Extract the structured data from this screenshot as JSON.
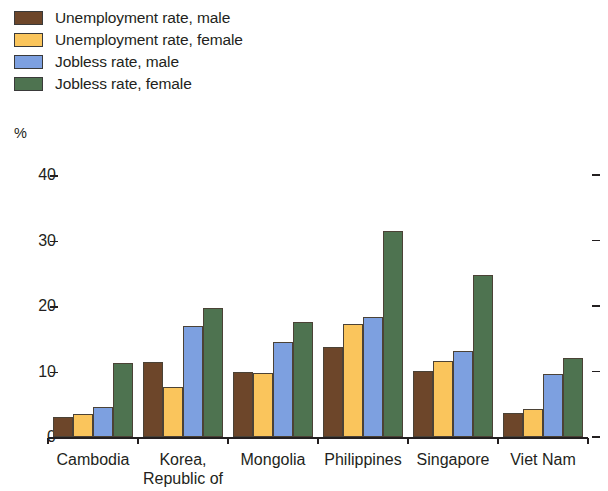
{
  "chart_data": {
    "type": "bar",
    "title": "",
    "subtitle": "",
    "xlabel": "",
    "ylabel": "%",
    "ylim": [
      0,
      40
    ],
    "yticks": [
      0,
      10,
      20,
      30,
      40
    ],
    "grid": false,
    "legend_position": "top-left",
    "categories": [
      "Cambodia",
      "Korea,\nRepublic of",
      "Mongolia",
      "Philippines",
      "Singapore",
      "Viet Nam"
    ],
    "category_lines": [
      [
        "Cambodia"
      ],
      [
        "Korea,",
        "Republic of"
      ],
      [
        "Mongolia"
      ],
      [
        "Philippines"
      ],
      [
        "Singapore"
      ],
      [
        "Viet Nam"
      ]
    ],
    "series": [
      {
        "name": "Unemployment rate, male",
        "color": "#6d462a",
        "values": [
          3.1,
          11.4,
          10.0,
          13.8,
          10.1,
          3.7
        ]
      },
      {
        "name": "Unemployment rate, female",
        "color": "#fac55c",
        "values": [
          3.5,
          7.6,
          9.8,
          17.3,
          11.6,
          4.2
        ]
      },
      {
        "name": "Jobless rate, male",
        "color": "#7da0e0",
        "values": [
          4.6,
          17.0,
          14.5,
          18.3,
          13.1,
          9.6
        ]
      },
      {
        "name": "Jobless rate, female",
        "color": "#4e7350",
        "values": [
          11.3,
          19.7,
          17.5,
          31.4,
          24.8,
          12.0
        ]
      }
    ]
  },
  "legend": {
    "items": [
      {
        "label": "Unemployment rate, male",
        "color": "#6d462a"
      },
      {
        "label": "Unemployment rate, female",
        "color": "#fac55c"
      },
      {
        "label": "Jobless rate, male",
        "color": "#7da0e0"
      },
      {
        "label": "Jobless rate, female",
        "color": "#4e7350"
      }
    ]
  },
  "axis": {
    "unit": "%",
    "y_tick_labels": [
      "40",
      "30",
      "20",
      "10",
      "0"
    ]
  }
}
